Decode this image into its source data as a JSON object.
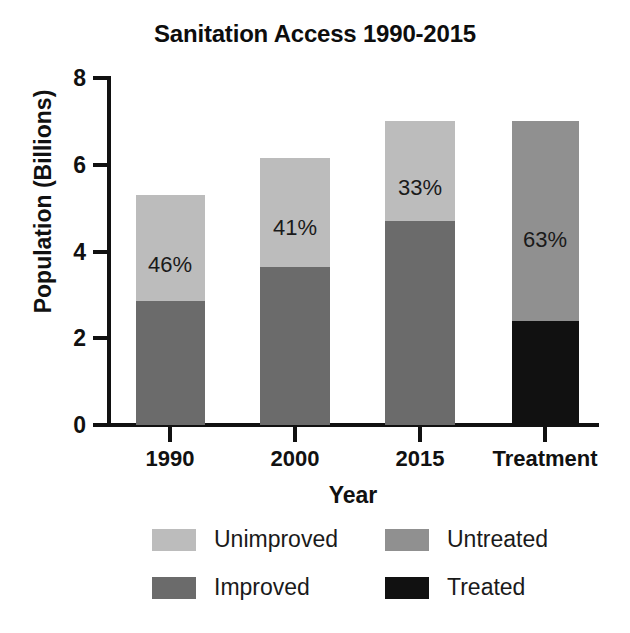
{
  "chart_data": {
    "type": "bar",
    "subtype": "stacked-bar",
    "title": "Sanitation Access 1990-2015",
    "xlabel": "Year",
    "ylabel": "Population (Billions)",
    "categories": [
      "1990",
      "2000",
      "2015",
      "Treatment"
    ],
    "ylim": [
      0,
      8
    ],
    "yticks": [
      0,
      2,
      4,
      6,
      8
    ],
    "ytick_labels": [
      "0",
      "2",
      "4",
      "6",
      "8"
    ],
    "grid": false,
    "legend_position": "bottom",
    "series": [
      {
        "name": "Improved",
        "color": "#6b6b6b",
        "values": [
          2.85,
          3.65,
          4.7,
          null
        ]
      },
      {
        "name": "Unimproved",
        "color": "#bcbcbc",
        "values": [
          2.45,
          2.5,
          2.3,
          null
        ]
      },
      {
        "name": "Treated",
        "color": "#111111",
        "values": [
          null,
          null,
          null,
          2.4
        ]
      },
      {
        "name": "Untreated",
        "color": "#909090",
        "values": [
          null,
          null,
          null,
          4.6
        ]
      }
    ],
    "totals": [
      5.3,
      6.15,
      7.0,
      7.0
    ],
    "annotations": [
      {
        "category": "1990",
        "text": "46%",
        "value": 46
      },
      {
        "category": "2000",
        "text": "41%",
        "value": 41
      },
      {
        "category": "2015",
        "text": "33%",
        "value": 33
      },
      {
        "category": "Treatment",
        "text": "63%",
        "value": 63
      }
    ],
    "legend": [
      {
        "label": "Unimproved",
        "color": "#bcbcbc"
      },
      {
        "label": "Untreated",
        "color": "#909090"
      },
      {
        "label": "Improved",
        "color": "#6b6b6b"
      },
      {
        "label": "Treated",
        "color": "#111111"
      }
    ]
  }
}
